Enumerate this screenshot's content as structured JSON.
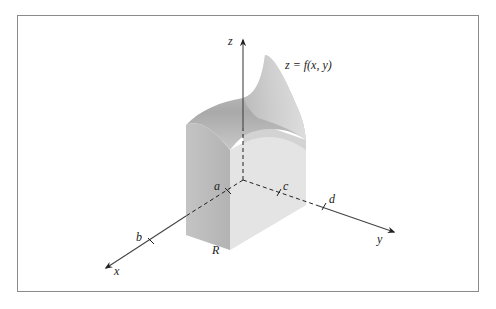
{
  "figure": {
    "type": "3d-solid-under-surface",
    "surface_label": "z = f(x, y)",
    "region_label": "R",
    "axes": {
      "x": "x",
      "y": "y",
      "z": "z"
    },
    "ticks": {
      "a": "a",
      "b": "b",
      "c": "c",
      "d": "d"
    },
    "colors": {
      "frame": "#8a8a8a",
      "axis": "#333333",
      "solid_left_face": "#b9b9b9",
      "solid_front_face": "#d9d9d9",
      "solid_back_face": "#cfcfcf",
      "region_base": "#ececec",
      "surface_top": "#c4c4c4"
    }
  }
}
